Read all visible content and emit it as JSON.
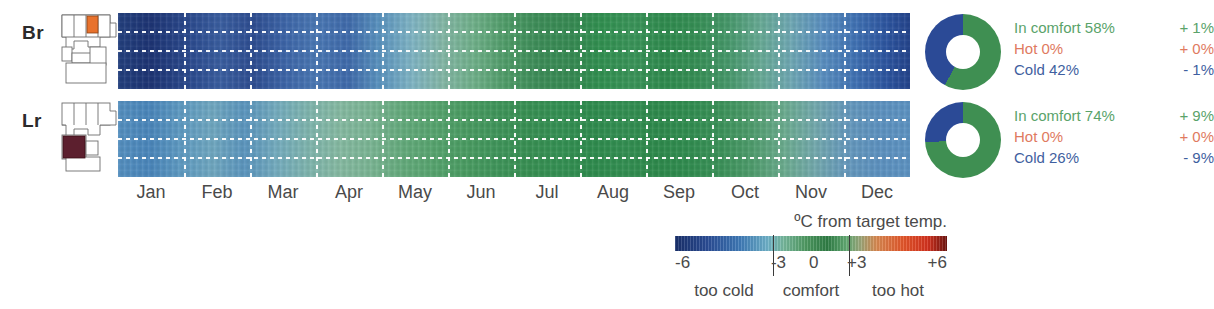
{
  "chart_data": {
    "type": "heatmap",
    "xlabel": "",
    "ylabel": "",
    "colorbar": {
      "title": "ºC from target temp.",
      "ticks": [
        {
          "label": "-6",
          "value": -6,
          "pos_pct": 0
        },
        {
          "label": "-3",
          "value": -3,
          "pos_pct": 36
        },
        {
          "label": "0",
          "value": 0,
          "pos_pct": 50
        },
        {
          "label": "+3",
          "value": 3,
          "pos_pct": 64
        },
        {
          "label": "+6",
          "value": 6,
          "pos_pct": 100
        }
      ],
      "zones": [
        {
          "label": "too cold",
          "from": -6,
          "to": -3
        },
        {
          "label": "comfort",
          "from": -3,
          "to": 3
        },
        {
          "label": "too hot",
          "from": 3,
          "to": 6
        }
      ],
      "stops": [
        {
          "pos_pct": 0,
          "color": "#19306b"
        },
        {
          "pos_pct": 12,
          "color": "#2b4d96"
        },
        {
          "pos_pct": 24,
          "color": "#3f7bb8"
        },
        {
          "pos_pct": 34,
          "color": "#6fb2c9"
        },
        {
          "pos_pct": 40,
          "color": "#77b89c"
        },
        {
          "pos_pct": 48,
          "color": "#4f9a62"
        },
        {
          "pos_pct": 56,
          "color": "#2f7d45"
        },
        {
          "pos_pct": 63,
          "color": "#63ab74"
        },
        {
          "pos_pct": 68,
          "color": "#9aa77a"
        },
        {
          "pos_pct": 74,
          "color": "#d98a52"
        },
        {
          "pos_pct": 84,
          "color": "#e4562a"
        },
        {
          "pos_pct": 93,
          "color": "#d4321f"
        },
        {
          "pos_pct": 100,
          "color": "#6d1410"
        }
      ]
    },
    "x_categories": [
      "Jan",
      "Feb",
      "Mar",
      "Apr",
      "May",
      "Jun",
      "Jul",
      "Aug",
      "Sep",
      "Oct",
      "Nov",
      "Dec"
    ],
    "rows": [
      {
        "name": "Br",
        "label": "Br",
        "plan_highlight_color": "#e8722d",
        "monthly_deviation_c": [
          -5.4,
          -4.6,
          -3.2,
          -1.2,
          -0.6,
          -0.3,
          -0.2,
          -0.3,
          -0.5,
          -1.6,
          -3.3,
          -5.0
        ],
        "donut": {
          "segments": [
            {
              "name": "In comfort",
              "value": 58,
              "color": "#3f8f52"
            },
            {
              "name": "Cold",
              "value": 42,
              "color": "#2b4a96"
            }
          ]
        },
        "stats": [
          {
            "label": "In comfort 58%",
            "delta": "+ 1%",
            "kind": "comfort"
          },
          {
            "label": "Hot 0%",
            "delta": "+ 0%",
            "kind": "hot"
          },
          {
            "label": "Cold 42%",
            "delta": "-  1%",
            "kind": "cold"
          }
        ]
      },
      {
        "name": "Lr",
        "label": "Lr",
        "plan_highlight_color": "#5c1f2e",
        "monthly_deviation_c": [
          -3.6,
          -3.1,
          -1.8,
          -0.6,
          -0.3,
          -0.2,
          -0.2,
          -0.2,
          -0.3,
          -0.7,
          -1.9,
          -3.4
        ],
        "donut": {
          "segments": [
            {
              "name": "In comfort",
              "value": 74,
              "color": "#3f8f52"
            },
            {
              "name": "Cold",
              "value": 26,
              "color": "#2b4a96"
            }
          ]
        },
        "stats": [
          {
            "label": "In comfort 74%",
            "delta": "+ 9%",
            "kind": "comfort"
          },
          {
            "label": "Hot 0%",
            "delta": "+ 0%",
            "kind": "hot"
          },
          {
            "label": "Cold 26%",
            "delta": "-  9%",
            "kind": "cold"
          }
        ]
      }
    ],
    "heat_gradients": {
      "br": "linear-gradient(90deg, #23407e 0%, #1d3474 4%, #2b4a8e 9%, #3a5ea0 13%, #2e4d91 17%, #3d65a8 21%, #4a78b4 25%, #3f6aab 29%, #5a93bf 33%, #7fb4c4 37%, #84b7a6 41%, #6fb089 45%, #4f9c68 49%, #3d8d58 53%, #378a53 57%, #319050 61%, #3a9459 65%, #2f8b4e 69%, #368f55 73%, #46986a 77%, #67aa94 81%, #6fa8b4 85%, #5a8fc0 89%, #4072b4 93%, #2d55a0 97%, #24448c 100%)",
      "lr": "linear-gradient(90deg, #5590c0 0%, #4a86bb 4%, #5f9bc2 8%, #70a8c0 12%, #5b95be 16%, #74acbe 20%, #7fb5ae 24%, #86baa2 28%, #7ab593 32%, #64ab7c 36%, #56a46e 40%, #4a9c62 44%, #3f955a 48%, #389053 52%, #349053 56%, #2f8c4e 60%, #338f52 64%, #2e8a4c 68%, #318d50 72%, #3b9259 76%, #4e9c6c 80%, #6bac8e 84%, #73a9ad 88%, #6699bd 92%, #5d92c0 96%, #5d93c2 100%)"
    }
  },
  "legend": {
    "title": "ºC from target temp."
  }
}
